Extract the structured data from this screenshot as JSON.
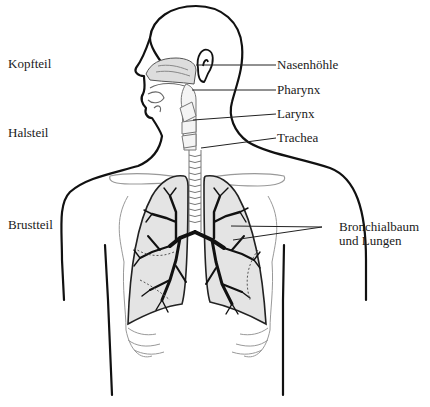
{
  "diagram": {
    "region_labels": [
      {
        "id": "kopfteil",
        "text": "Kopfteil"
      },
      {
        "id": "halsteil",
        "text": "Halsteil"
      },
      {
        "id": "brustteil",
        "text": "Brustteil"
      }
    ],
    "organ_labels": [
      {
        "id": "nasenhoehle",
        "text": "Nasenhöhle"
      },
      {
        "id": "pharynx",
        "text": "Pharynx"
      },
      {
        "id": "larynx",
        "text": "Larynx"
      },
      {
        "id": "trachea",
        "text": "Trachea"
      },
      {
        "id": "bronchialbaum",
        "text": "Bronchialbaum"
      },
      {
        "id": "lungen",
        "text": "und Lungen"
      }
    ],
    "colors": {
      "outline": "#111111",
      "lung_fill": "#e4e4e4",
      "rib_stroke": "#8a8a8a",
      "nasal_fill": "#dddddd",
      "background": "#ffffff"
    }
  }
}
